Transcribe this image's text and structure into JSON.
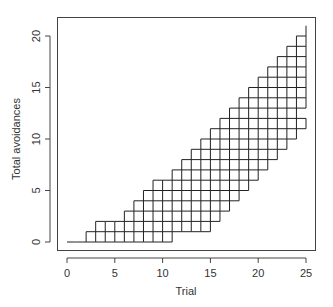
{
  "chart_data": {
    "type": "line",
    "subtype": "step-lattice",
    "title": "",
    "xlabel": "Trial",
    "ylabel": "Total avoidances",
    "xlim": [
      0,
      25
    ],
    "ylim": [
      0,
      21
    ],
    "x_ticks": [
      0,
      5,
      10,
      15,
      20,
      25
    ],
    "y_ticks": [
      0,
      5,
      10,
      15,
      20
    ],
    "grid": false,
    "legend": null,
    "intervals_start_trial": [
      0,
      1,
      2,
      3,
      4,
      5,
      6,
      7,
      8,
      9,
      10,
      11,
      12,
      13,
      14,
      15,
      16,
      17,
      18,
      19,
      20,
      21,
      22,
      23,
      24
    ],
    "upper_envelope": [
      0,
      0,
      1,
      2,
      2,
      2,
      3,
      4,
      5,
      6,
      6,
      7,
      8,
      9,
      10,
      11,
      12,
      13,
      14,
      15,
      16,
      17,
      18,
      19,
      20
    ],
    "lower_envelope": [
      0,
      0,
      0,
      0,
      0,
      0,
      0,
      0,
      0,
      0,
      0,
      1,
      1,
      1,
      1,
      2,
      3,
      4,
      5,
      6,
      7,
      8,
      9,
      10,
      11
    ],
    "final_vertical": {
      "trial": 25,
      "from": 11,
      "to": 21,
      "gaps": [
        [
          12,
          13
        ]
      ]
    }
  },
  "axes": {
    "x_tick_labels": [
      "0",
      "5",
      "10",
      "15",
      "20",
      "25"
    ],
    "y_tick_labels": [
      "0",
      "5",
      "10",
      "15",
      "20"
    ],
    "xlabel": "Trial",
    "ylabel": "Total avoidances"
  },
  "colors": {
    "line": "#222222",
    "axis": "#444444",
    "text": "#333333"
  }
}
